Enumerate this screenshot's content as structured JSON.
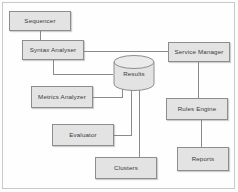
{
  "diagram": {
    "background_color": "#fdfdfd",
    "node_fill_color": "#e3e3e3",
    "node_border_color": "#8d8d8d",
    "connector_color": "#8a8a8a",
    "nodes": [
      {
        "id": "sequencer",
        "label": "Sequencer",
        "shape": "rectangle",
        "x": 9,
        "y": 11,
        "w": 62,
        "h": 20
      },
      {
        "id": "syntax_analyser",
        "label": "Syntax Analyser",
        "shape": "rectangle",
        "x": 22,
        "y": 40,
        "w": 62,
        "h": 20
      },
      {
        "id": "service_manager",
        "label": "Service Manager",
        "shape": "rectangle",
        "x": 168,
        "y": 42,
        "w": 62,
        "h": 20
      },
      {
        "id": "results",
        "label": "Results",
        "shape": "cylinder",
        "x": 113,
        "y": 55,
        "w": 42,
        "h": 36
      },
      {
        "id": "metrics_analyzer",
        "label": "Metrics Analyzer",
        "shape": "rectangle",
        "x": 31,
        "y": 86,
        "w": 62,
        "h": 22
      },
      {
        "id": "rules_engine",
        "label": "Rules Engine",
        "shape": "rectangle",
        "x": 166,
        "y": 98,
        "w": 62,
        "h": 22
      },
      {
        "id": "evaluator",
        "label": "Evaluator",
        "shape": "rectangle",
        "x": 52,
        "y": 124,
        "w": 62,
        "h": 22
      },
      {
        "id": "clusters",
        "label": "Clusters",
        "shape": "rectangle",
        "x": 95,
        "y": 157,
        "w": 62,
        "h": 22
      },
      {
        "id": "reports",
        "label": "Reports",
        "shape": "rectangle",
        "x": 177,
        "y": 147,
        "w": 52,
        "h": 24
      }
    ],
    "connectors": [
      {
        "id": "sequencer-to-syntax",
        "from": "sequencer",
        "to": "syntax_analyser",
        "path": "M 40 31 L 40 40"
      },
      {
        "id": "syntax-to-service-manager",
        "from": "syntax_analyser",
        "to": "service_manager",
        "path": "M 84 51 L 168 51"
      },
      {
        "id": "syntax-to-results",
        "from": "syntax_analyser",
        "to": "results",
        "path": "M 53 60 L 53 74 L 113 74"
      },
      {
        "id": "metrics-to-results",
        "from": "metrics_analyzer",
        "to": "results",
        "path": "M 93 97 L 122 97 L 122 88"
      },
      {
        "id": "evaluator-to-results",
        "from": "evaluator",
        "to": "results",
        "path": "M 114 135 L 131 135 L 131 88"
      },
      {
        "id": "results-to-clusters",
        "from": "results",
        "to": "clusters",
        "path": "M 139 88 L 139 157"
      },
      {
        "id": "service-manager-to-rules",
        "from": "service_manager",
        "to": "rules_engine",
        "path": "M 198 62 L 198 98"
      },
      {
        "id": "rules-to-reports",
        "from": "rules_engine",
        "to": "reports",
        "path": "M 201 120 L 201 147"
      }
    ]
  }
}
